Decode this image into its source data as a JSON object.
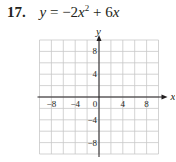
{
  "problem": {
    "number": "17.",
    "equation": "y = −2x² + 6x",
    "equation_parts": {
      "lhs": "y",
      "eq": " = ",
      "a": "−2",
      "var": "x",
      "exp": "2",
      "rest": " + 6",
      "var2": "x"
    }
  },
  "chart_data": {
    "type": "line",
    "xlabel": "x",
    "ylabel": "y",
    "xlim": [
      -10,
      10
    ],
    "ylim": [
      -10,
      10
    ],
    "grid": true,
    "grid_step": 2,
    "x_ticks": [
      -8,
      -4,
      0,
      4,
      8
    ],
    "y_ticks": [
      8,
      4,
      -4,
      -8
    ],
    "x_tick_labels": [
      "−8",
      "−4",
      "0",
      "4",
      "8"
    ],
    "y_tick_labels": [
      "8",
      "4",
      "−4",
      "−8"
    ],
    "series": [],
    "note": "Blank coordinate grid provided for graphing; no curve plotted"
  }
}
